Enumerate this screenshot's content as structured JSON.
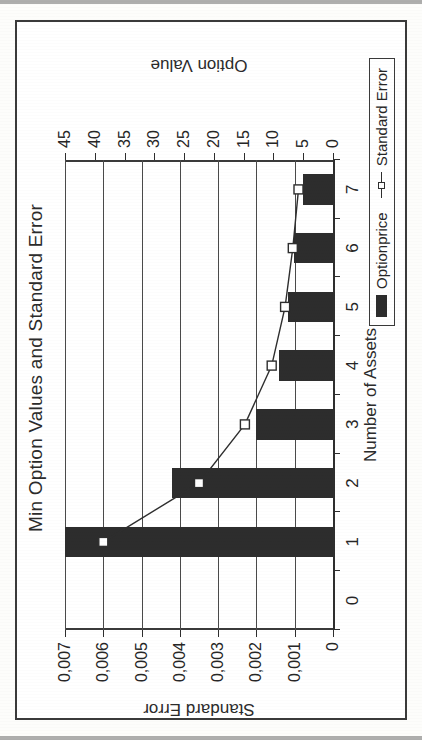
{
  "chart_data": {
    "type": "bar",
    "title": "Min Option Values and Standard Error",
    "xlabel": "Number of Assets",
    "categories": [
      "0",
      "1",
      "2",
      "3",
      "4",
      "5",
      "6",
      "7"
    ],
    "grid": true,
    "legend_position": "bottom-right",
    "axes": {
      "left": {
        "label": "Standard Error",
        "ticks": [
          "0",
          "0,001",
          "0,002",
          "0,003",
          "0,004",
          "0,005",
          "0,006",
          "0,007"
        ],
        "tick_values": [
          0,
          0.001,
          0.002,
          0.003,
          0.004,
          0.005,
          0.006,
          0.007
        ],
        "lim": [
          0,
          0.007
        ]
      },
      "right": {
        "label": "Option Value",
        "ticks": [
          "0",
          "5",
          "10",
          "15",
          "20",
          "25",
          "30",
          "35",
          "40",
          "45"
        ],
        "tick_values": [
          0,
          5,
          10,
          15,
          20,
          25,
          30,
          35,
          40,
          45
        ],
        "lim": [
          0,
          45
        ]
      }
    },
    "series": [
      {
        "name": "Optionprice",
        "type": "bar",
        "axis": "right",
        "x": [
          1,
          2,
          3,
          4,
          5,
          6,
          7
        ],
        "values": [
          45,
          27,
          13,
          9,
          7.5,
          6.5,
          5
        ]
      },
      {
        "name": "Standard Error",
        "type": "line",
        "axis": "left",
        "marker": "square",
        "x": [
          1,
          2,
          3,
          4,
          5,
          6,
          7
        ],
        "values": [
          0.006,
          0.0035,
          0.0023,
          0.0016,
          0.00125,
          0.00105,
          0.0009
        ]
      }
    ]
  },
  "legend": {
    "items": [
      {
        "label": "Optionprice",
        "swatch": "filled-bar",
        "color": "#2d2d2d"
      },
      {
        "label": "Standard Error",
        "swatch": "line-square-marker",
        "color": "#2e2e2e"
      }
    ]
  }
}
